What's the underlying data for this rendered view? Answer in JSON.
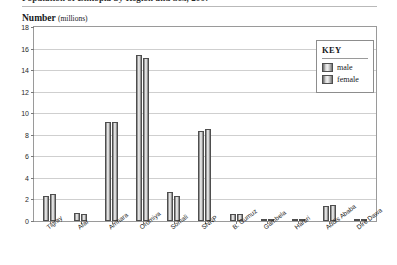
{
  "title": "Population of Ethiopia by Region and Sex, 2007",
  "axis_caption": {
    "text": "Number",
    "unit": "(millions)"
  },
  "legend": {
    "title": "KEY",
    "entries": [
      {
        "label": "male",
        "color": "#9a9a9a"
      },
      {
        "label": "female",
        "color": "#9a9a9a"
      }
    ]
  },
  "chart_data": {
    "type": "bar",
    "title": "Population of Ethiopia by Region and Sex, 2007",
    "xlabel": "",
    "ylabel": "Number (millions)",
    "ylim": [
      0,
      18
    ],
    "yticks": [
      0,
      2,
      4,
      6,
      8,
      10,
      12,
      14,
      16,
      18
    ],
    "ytick_labels": [
      "0",
      "2",
      "4",
      "6",
      "8",
      "10",
      "12",
      "14",
      "16",
      "18"
    ],
    "grid": true,
    "legend_position": "top-right",
    "categories": [
      "Tigray",
      "Afar",
      "Amhara",
      "Oromiya",
      "Somali",
      "SNNP",
      "B. Gumuz",
      "Gambela",
      "Harari",
      "Addis Ababa",
      "Dire Dawa"
    ],
    "series": [
      {
        "name": "male",
        "values": [
          2.35,
          0.79,
          9.2,
          15.4,
          2.7,
          8.35,
          0.66,
          0.22,
          0.1,
          1.35,
          0.2
        ]
      },
      {
        "name": "female",
        "values": [
          2.5,
          0.63,
          9.2,
          15.1,
          2.3,
          8.5,
          0.62,
          0.18,
          0.09,
          1.5,
          0.2
        ]
      }
    ]
  }
}
